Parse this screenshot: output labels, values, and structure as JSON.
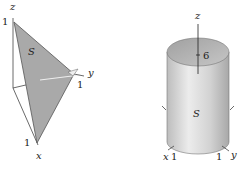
{
  "figures": [
    {
      "id": "left",
      "description": "Triangular surface S in first octant with vertices on axes",
      "labels": {
        "z_axis": "z",
        "z_intercept": "1",
        "surface": "S",
        "y_axis": "y",
        "y_intercept": "1",
        "x_intercept": "1",
        "x_axis": "x"
      },
      "fill_color": "#a9a9a9"
    },
    {
      "id": "right",
      "description": "Cylindrical surface S of radius 1 and height 6",
      "labels": {
        "z_axis": "z",
        "height": "6",
        "surface": "S",
        "x_axis": "x",
        "x_intercept": "1",
        "y_intercept": "1",
        "y_axis": "y"
      },
      "fill_color": "#c8c8c8"
    }
  ]
}
